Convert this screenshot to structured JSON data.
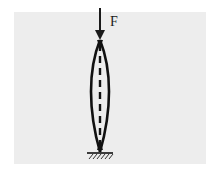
{
  "diagram": {
    "type": "buckling-column",
    "force": {
      "label": "F",
      "direction": "down",
      "color": "#1a1a1a"
    },
    "column": {
      "shape": "double-convex-buckled",
      "centerline_style": "dashed",
      "color": "#111111"
    },
    "support": {
      "type": "fixed-ground",
      "hatch": true
    },
    "background": {
      "page": "#ffffff",
      "panel": "#ededed"
    }
  }
}
